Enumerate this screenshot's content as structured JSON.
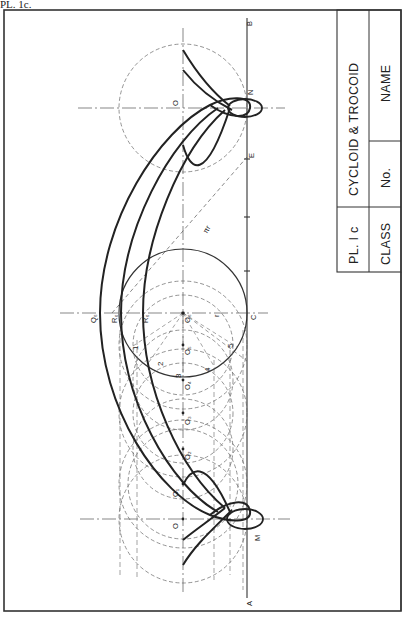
{
  "plate_label": "PL. 1c.",
  "title_block": {
    "plate_no": "PL. I c",
    "title": "CYCLOID & TROCOID",
    "class_label": "CLASS",
    "no_label": "No.",
    "name_label": "NAME"
  },
  "drawing": {
    "baseline_end_a": "A",
    "baseline_end_b": "B",
    "point_m": "M",
    "point_n": "N",
    "point_c": "C",
    "point_e": "E",
    "point_o_top": "O",
    "point_o_bottom": "O",
    "centre_labels": [
      "O₁",
      "O₂",
      "O₃",
      "O₄",
      "O₅",
      "O₆"
    ],
    "q6": "Q₆",
    "r6": "R₆",
    "r6_inner": "R₆",
    "radius_label": "r",
    "pi_r_label": "πr",
    "division_numbers": [
      "1",
      "2",
      "3",
      "4",
      "5"
    ],
    "colors": {
      "ink": "#222222",
      "construction": "#555555",
      "paper": "#ffffff"
    }
  }
}
